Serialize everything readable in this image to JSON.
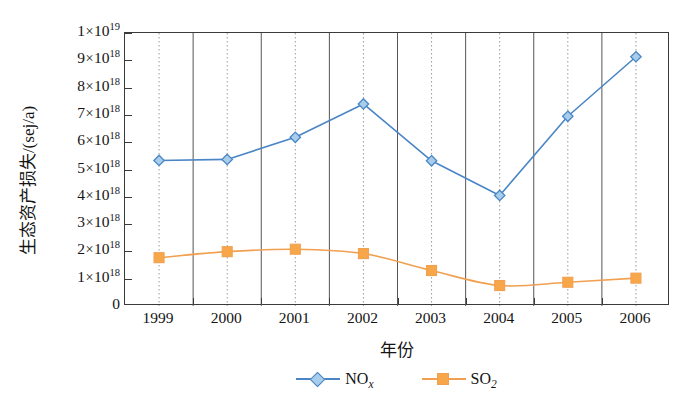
{
  "chart_data": {
    "type": "line",
    "title": "",
    "xlabel": "年份",
    "ylabel": "生态资产损失/(sej/a)",
    "categories": [
      "1999",
      "2000",
      "2001",
      "2002",
      "2003",
      "2004",
      "2005",
      "2006"
    ],
    "ylim": [
      0,
      1e+19
    ],
    "ytick_values": [
      0,
      1e+18,
      2e+18,
      3e+18,
      4e+18,
      5e+18,
      6e+18,
      7e+18,
      8e+18,
      9e+18,
      1e+19
    ],
    "ytick_labels": [
      {
        "coef": "0",
        "show_power": false,
        "exp": ""
      },
      {
        "coef": "1",
        "show_power": true,
        "exp": "18"
      },
      {
        "coef": "2",
        "show_power": true,
        "exp": "18"
      },
      {
        "coef": "3",
        "show_power": true,
        "exp": "18"
      },
      {
        "coef": "4",
        "show_power": true,
        "exp": "18"
      },
      {
        "coef": "5",
        "show_power": true,
        "exp": "18"
      },
      {
        "coef": "6",
        "show_power": true,
        "exp": "18"
      },
      {
        "coef": "7",
        "show_power": true,
        "exp": "18"
      },
      {
        "coef": "8",
        "show_power": true,
        "exp": "18"
      },
      {
        "coef": "9",
        "show_power": true,
        "exp": "18"
      },
      {
        "coef": "1",
        "show_power": true,
        "exp": "19"
      }
    ],
    "grid": {
      "vertical_major": true,
      "vertical_minor_dotted": true,
      "horizontal": false
    },
    "legend": {
      "position": "bottom-center"
    },
    "series": [
      {
        "name": "NOx",
        "label_main": "NO",
        "label_sub": "x",
        "color": "#4a86c5",
        "marker": "diamond",
        "marker_fill": "#a8cdea",
        "smooth": false,
        "values": [
          5.33e+18,
          5.37e+18,
          6.18e+18,
          7.4e+18,
          5.32e+18,
          4.05e+18,
          6.95e+18,
          9.13e+18
        ]
      },
      {
        "name": "SO2",
        "label_main": "SO",
        "label_sub": "2",
        "color": "#f0a050",
        "marker": "square",
        "marker_fill": "#f7a74a",
        "smooth": true,
        "values": [
          1.77e+18,
          1.99e+18,
          2.08e+18,
          1.92e+18,
          1.3e+18,
          7.5e+17,
          8.7e+17,
          1.02e+18
        ]
      }
    ]
  },
  "legend_items": [
    {
      "main": "NO",
      "sub": "x",
      "sub_italic": true
    },
    {
      "main": "SO",
      "sub": "2",
      "sub_italic": false
    }
  ]
}
